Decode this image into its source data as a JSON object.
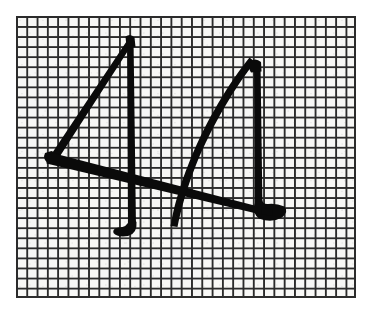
{
  "scene": {
    "title": "Handwritten stroke sketch on graph paper",
    "medium": "black ink pen on printed grid paper",
    "canvas_width": 372,
    "canvas_height": 314,
    "background_color": "#ffffff"
  },
  "paper": {
    "name": "graph-paper-sheet",
    "left": 16,
    "top": 16,
    "width": 340,
    "height": 282,
    "fill_color": "#f7f7f5",
    "grid_line_color": "#2b2b2b",
    "grid_cell_px": 10.3,
    "grid_line_width_px": 1.6,
    "border_color": "#2b2b2b",
    "border_width_px": 2,
    "columns": 33,
    "rows": 28
  },
  "drawing": {
    "name": "two-overlapping-angular-strokes",
    "ink_color": "#0a0a0a",
    "stroke_count": 2,
    "description": "Two large hand-drawn angular figures resembling the digit four, drawn overlapping across the grid",
    "strokes": [
      {
        "id": "left-figure",
        "label": "Left angular four",
        "apex": [
          128,
          38
        ],
        "left_vertex": [
          49,
          158
        ],
        "vertical_top": [
          130,
          38
        ],
        "vertical_bottom_hook": [
          128,
          234
        ],
        "crossbar_end": [
          262,
          212
        ],
        "thickness_px": 6
      },
      {
        "id": "right-figure",
        "label": "Right curved four",
        "apex": [
          256,
          62
        ],
        "curve_low": [
          176,
          224
        ],
        "vertical_top": [
          258,
          63
        ],
        "vertical_bottom_hook": [
          272,
          215
        ],
        "thickness_px": 6
      }
    ]
  }
}
